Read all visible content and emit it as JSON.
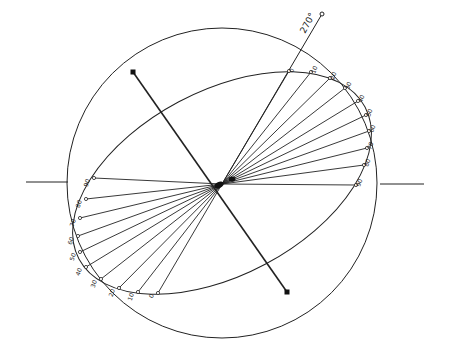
{
  "diagram": {
    "center": {
      "x": 222,
      "y": 184
    },
    "circle": {
      "cx": 222,
      "cy": 183,
      "r": 155
    },
    "ellipse": {
      "cx": 222,
      "cy": 183,
      "rx": 162,
      "ry": 92,
      "rotate": -28
    },
    "horizontal_axis": {
      "left": [
        26,
        182,
        68,
        182
      ],
      "right": [
        380,
        184,
        424,
        184
      ]
    },
    "tilted_axis": {
      "start": [
        133,
        72
      ],
      "end": [
        287,
        292
      ]
    },
    "angle_marker": {
      "label": "270°",
      "end": [
        322,
        14
      ]
    },
    "right_labels": [
      {
        "text": "0",
        "x": 289,
        "y": 71
      },
      {
        "text": "10",
        "x": 311,
        "y": 72
      },
      {
        "text": "20",
        "x": 330,
        "y": 78
      },
      {
        "text": "30",
        "x": 345,
        "y": 88
      },
      {
        "text": "40",
        "x": 358,
        "y": 101
      },
      {
        "text": "50",
        "x": 366,
        "y": 115
      },
      {
        "text": "60",
        "x": 369,
        "y": 131
      },
      {
        "text": "70",
        "x": 367,
        "y": 148
      },
      {
        "text": "80",
        "x": 364,
        "y": 165
      },
      {
        "text": "90",
        "x": 356,
        "y": 185
      }
    ],
    "left_labels": [
      {
        "text": "90",
        "x": 94,
        "y": 178
      },
      {
        "text": "80",
        "x": 86,
        "y": 199
      },
      {
        "text": "70",
        "x": 80,
        "y": 218
      },
      {
        "text": "60",
        "x": 78,
        "y": 236
      },
      {
        "text": "50",
        "x": 80,
        "y": 252
      },
      {
        "text": "40",
        "x": 86,
        "y": 267
      },
      {
        "text": "30",
        "x": 101,
        "y": 279
      },
      {
        "text": "20",
        "x": 119,
        "y": 288
      },
      {
        "text": "10",
        "x": 138,
        "y": 292
      },
      {
        "text": "0",
        "x": 158,
        "y": 293
      }
    ]
  }
}
